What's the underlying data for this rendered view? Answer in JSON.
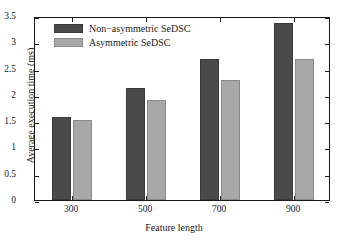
{
  "chart_data": {
    "type": "bar",
    "title": "",
    "xlabel": "Feature length",
    "ylabel": "Average execution time (ms)",
    "categories": [
      "300",
      "500",
      "700",
      "900"
    ],
    "series": [
      {
        "name": "Non−asymmetric SeDSC",
        "color": "#4a4a4a",
        "values": [
          1.58,
          2.13,
          2.69,
          3.37
        ]
      },
      {
        "name": "Asymmetric SeDSC",
        "color": "#a8a8a8",
        "values": [
          1.52,
          1.91,
          2.28,
          2.69
        ]
      }
    ],
    "ylim": [
      0,
      3.5
    ],
    "yticks": [
      "0",
      "0.5",
      "1",
      "1.5",
      "2",
      "2.5",
      "3",
      "3.5"
    ],
    "ytick_values": [
      0,
      0.5,
      1,
      1.5,
      2,
      2.5,
      3,
      3.5
    ],
    "grid": false,
    "legend_position": "top-left",
    "axis_box": true,
    "tick_direction": "in"
  },
  "legend": {
    "entries": [
      {
        "label": "Non−asymmetric SeDSC"
      },
      {
        "label": "Asymmetric SeDSC"
      }
    ]
  }
}
